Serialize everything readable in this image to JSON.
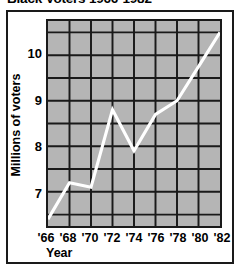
{
  "chart_data": {
    "type": "line",
    "title": "Black Voters 1966-1982",
    "xlabel": "Year",
    "ylabel": "Millions of voters",
    "x": [
      1966,
      1968,
      1970,
      1972,
      1974,
      1976,
      1978,
      1980,
      1982
    ],
    "categories": [
      "'66",
      "'68",
      "'70",
      "'72",
      "'74",
      "'76",
      "'78",
      "'80",
      "'82"
    ],
    "values": [
      6.4,
      7.2,
      7.1,
      8.8,
      7.9,
      8.7,
      9.0,
      9.75,
      10.5
    ],
    "series": [
      {
        "name": "Millions of voters",
        "values": [
          6.4,
          7.2,
          7.1,
          8.8,
          7.9,
          8.7,
          9.0,
          9.75,
          10.5
        ]
      }
    ],
    "xlim": [
      1966,
      1982
    ],
    "ylim": [
      6.25,
      10.75
    ],
    "ytick_labels": [
      "7",
      "8",
      "9",
      "10"
    ],
    "ytick_values": [
      7,
      8,
      9,
      10
    ],
    "gridlines": {
      "horizontal_step": 0.5,
      "horizontal_values": [
        6.75,
        7.25,
        7.75,
        8.25,
        8.75,
        9.25,
        9.75,
        10.25
      ],
      "vertical_values": [
        1968,
        1970,
        1972,
        1974,
        1976,
        1978,
        1980
      ],
      "grid_on": true
    },
    "legend": null,
    "legend_position": "none",
    "colors": {
      "line": "#ffffff",
      "plot_background": "#b5b5b5",
      "grid": "#1a1a1a",
      "frame": "#1a1a1a",
      "page_background": "#ffffff",
      "text": "#000000"
    },
    "annotations": []
  }
}
